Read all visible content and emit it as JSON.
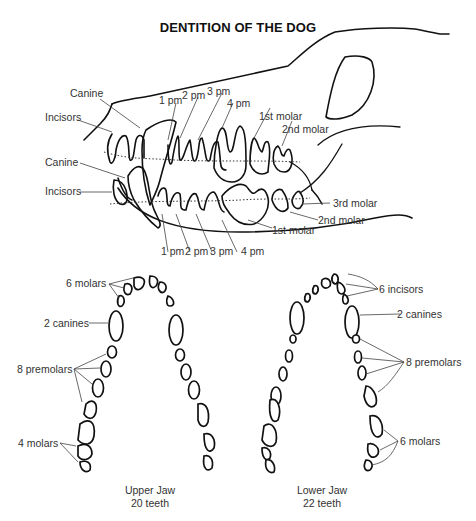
{
  "title": "DENTITION OF THE DOG",
  "skull_side_view": {
    "upper_labels": {
      "canine": "Canine",
      "incisors": "Incisors",
      "pm1": "1 pm",
      "pm2": "2 pm",
      "pm3": "3 pm",
      "pm4": "4 pm",
      "molar1": "1st molar",
      "molar2": "2nd molar"
    },
    "lower_labels": {
      "canine": "Canine",
      "incisors": "Incisors",
      "pm1": "1 pm",
      "pm2": "2 pm",
      "pm3": "3 pm",
      "pm4": "4 pm",
      "molar1": "1st molar",
      "molar2": "2nd molar",
      "molar3": "3rd molar"
    }
  },
  "upper_jaw": {
    "labels": {
      "front": "6 molars",
      "canines": "2 canines",
      "premolars": "8 premolars",
      "molars": "4 molars"
    },
    "caption_line1": "Upper Jaw",
    "caption_line2": "20 teeth"
  },
  "lower_jaw": {
    "labels": {
      "incisors": "6 incisors",
      "canines": "2 canines",
      "premolars": "8 premolars",
      "molars": "6 molars"
    },
    "caption_line1": "Lower Jaw",
    "caption_line2": "22 teeth"
  }
}
